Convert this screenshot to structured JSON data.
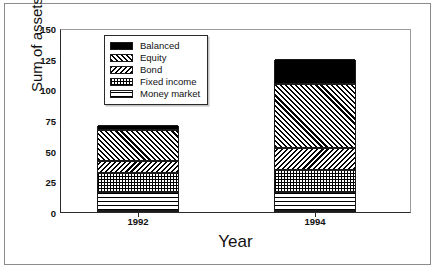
{
  "chart_data": {
    "type": "bar",
    "subtype": "stacked-bar",
    "title": "",
    "xlabel": "Year",
    "ylabel": "Sum of assets",
    "categories": [
      "1992",
      "1994"
    ],
    "ylim": [
      0,
      150
    ],
    "yticks": [
      0,
      25,
      50,
      75,
      100,
      125,
      150
    ],
    "ytick_labels": [
      "0",
      "25",
      "50",
      "75",
      "100",
      "125",
      "150"
    ],
    "grid": false,
    "legend_position": "upper-center-left",
    "series": [
      {
        "name": "Balanced",
        "pattern": "solid-black",
        "values": [
          4,
          20
        ]
      },
      {
        "name": "Equity",
        "pattern": "diagonal-forward",
        "values": [
          26,
          53
        ]
      },
      {
        "name": "Bond",
        "pattern": "diagonal-backward",
        "values": [
          10,
          18
        ]
      },
      {
        "name": "Fixed income",
        "pattern": "dotted-grid",
        "values": [
          15,
          18
        ]
      },
      {
        "name": "Money market",
        "pattern": "horizontal-lines",
        "values": [
          16,
          16
        ]
      }
    ],
    "totals": [
      71,
      125
    ]
  },
  "axes": {
    "ylabel": "Sum of assets",
    "xlabel": "Year",
    "ytick_labels": [
      "150",
      "125",
      "100",
      "75",
      "50",
      "25",
      "0"
    ],
    "xtick_labels": [
      "1992",
      "1994"
    ]
  },
  "legend": {
    "items": [
      {
        "label": "Balanced"
      },
      {
        "label": "Equity"
      },
      {
        "label": "Bond"
      },
      {
        "label": "Fixed income"
      },
      {
        "label": "Money market"
      }
    ]
  },
  "colors": {
    "ink": "#000000",
    "frame": "#8c8c8c",
    "axis": "#2a2a2a",
    "background": "#ffffff"
  }
}
